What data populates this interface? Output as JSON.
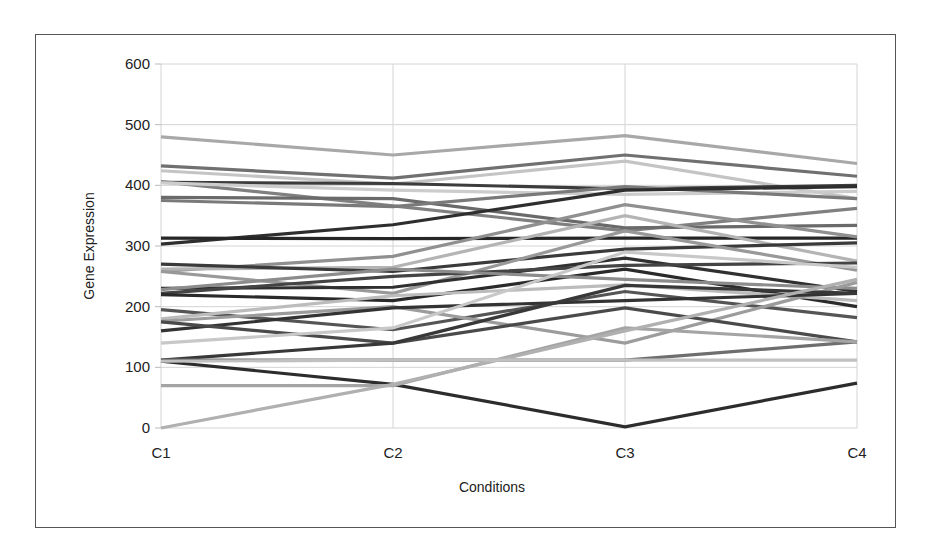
{
  "chart_data": {
    "type": "line",
    "title": "",
    "xlabel": "Conditions",
    "ylabel": "Gene Expression",
    "categories": [
      "C1",
      "C2",
      "C3",
      "C4"
    ],
    "ylim": [
      0,
      600
    ],
    "yticks": [
      0,
      100,
      200,
      300,
      400,
      500,
      600
    ],
    "grid": true,
    "legend": "none",
    "series": [
      {
        "name": "gene1",
        "color": "#a8a8a8",
        "values": [
          480,
          450,
          482,
          436
        ]
      },
      {
        "name": "gene2",
        "color": "#707070",
        "values": [
          432,
          412,
          450,
          415
        ]
      },
      {
        "name": "gene3",
        "color": "#c4c4c4",
        "values": [
          424,
          402,
          440,
          378
        ]
      },
      {
        "name": "gene4",
        "color": "#3c3c3c",
        "values": [
          405,
          403,
          394,
          400
        ]
      },
      {
        "name": "gene5",
        "color": "#808080",
        "values": [
          406,
          366,
          325,
          362
        ]
      },
      {
        "name": "gene6",
        "color": "#cccccc",
        "values": [
          404,
          392,
          385,
          390
        ]
      },
      {
        "name": "gene7",
        "color": "#6a6a6a",
        "values": [
          380,
          378,
          330,
          334
        ]
      },
      {
        "name": "gene8",
        "color": "#7a7a7a",
        "values": [
          375,
          365,
          398,
          378
        ]
      },
      {
        "name": "gene9",
        "color": "#2e2e2e",
        "values": [
          303,
          335,
          392,
          398
        ]
      },
      {
        "name": "gene10",
        "color": "#262626",
        "values": [
          313,
          312,
          313,
          313
        ]
      },
      {
        "name": "gene11",
        "color": "#909090",
        "values": [
          258,
          283,
          368,
          315
        ]
      },
      {
        "name": "gene12",
        "color": "#b4b4b4",
        "values": [
          262,
          265,
          350,
          275
        ]
      },
      {
        "name": "gene13",
        "color": "#3a3a3a",
        "values": [
          270,
          258,
          295,
          305
        ]
      },
      {
        "name": "gene14",
        "color": "#999999",
        "values": [
          258,
          222,
          325,
          260
        ]
      },
      {
        "name": "gene15",
        "color": "#303030",
        "values": [
          230,
          232,
          280,
          225
        ]
      },
      {
        "name": "gene16",
        "color": "#444444",
        "values": [
          222,
          250,
          268,
          272
        ]
      },
      {
        "name": "gene17",
        "color": "#2a2a2a",
        "values": [
          220,
          210,
          262,
          200
        ]
      },
      {
        "name": "gene18",
        "color": "#8c8c8c",
        "values": [
          228,
          262,
          245,
          230
        ]
      },
      {
        "name": "gene19",
        "color": "#555555",
        "values": [
          195,
          162,
          225,
          182
        ]
      },
      {
        "name": "gene20",
        "color": "#bcbcbc",
        "values": [
          180,
          218,
          236,
          210
        ]
      },
      {
        "name": "gene21",
        "color": "#9c9c9c",
        "values": [
          176,
          200,
          140,
          240
        ]
      },
      {
        "name": "gene22",
        "color": "#333333",
        "values": [
          160,
          198,
          210,
          222
        ]
      },
      {
        "name": "gene23",
        "color": "#4a4a4a",
        "values": [
          175,
          140,
          198,
          142
        ]
      },
      {
        "name": "gene24",
        "color": "#c8c8c8",
        "values": [
          140,
          165,
          290,
          265
        ]
      },
      {
        "name": "gene25",
        "color": "#383838",
        "values": [
          112,
          140,
          235,
          222
        ]
      },
      {
        "name": "gene26",
        "color": "#6e6e6e",
        "values": [
          112,
          112,
          112,
          142
        ]
      },
      {
        "name": "gene27",
        "color": "#2c2c2c",
        "values": [
          110,
          72,
          2,
          74
        ]
      },
      {
        "name": "gene28",
        "color": "#a4a4a4",
        "values": [
          70,
          70,
          165,
          142
        ]
      },
      {
        "name": "gene29",
        "color": "#b0b0b0",
        "values": [
          0,
          72,
          160,
          245
        ]
      },
      {
        "name": "gene30",
        "color": "#c0c0c0",
        "values": [
          110,
          112,
          112,
          112
        ]
      }
    ]
  }
}
